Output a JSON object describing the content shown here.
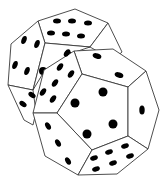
{
  "image": {
    "subject": "Two dodecahedral dice with pips",
    "description": "Line illustration of two twelve-sided (dodecahedron) dice, one behind the other, with black oval pips on white faces",
    "colors": {
      "background": "#ffffff",
      "face_fill": "#ffffff",
      "edge_stroke": "#3a3a3a",
      "pip": "#000000"
    }
  },
  "dice": [
    {
      "name": "back-die",
      "visible_faces": [
        {
          "name": "top",
          "pips": 6
        },
        {
          "name": "left-upper",
          "pips": 4
        },
        {
          "name": "left-lower",
          "pips": 2
        }
      ]
    },
    {
      "name": "front-die",
      "visible_faces": [
        {
          "name": "top",
          "pips": 2
        },
        {
          "name": "upper-left",
          "pips": 6
        },
        {
          "name": "center",
          "pips": 4
        },
        {
          "name": "right",
          "pips": 1
        },
        {
          "name": "lower-left",
          "pips": 3
        },
        {
          "name": "bottom",
          "pips": 6
        }
      ]
    }
  ]
}
